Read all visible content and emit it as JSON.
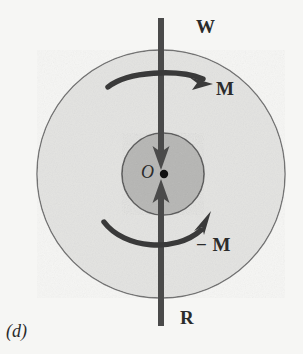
{
  "figure": {
    "caption": "(d)",
    "background_color": "#f6f6f4",
    "outer_disk": {
      "name": "outer-disk",
      "fill_color": "#e3e3e1",
      "stroke_color": "#6f6f6f",
      "center_x": 161,
      "center_y": 174,
      "radius": 124
    },
    "inner_disk": {
      "name": "inner-disk",
      "fill_color": "#b6b6b4",
      "stroke_color": "#5a5a5a",
      "center_x": 163,
      "center_y": 174,
      "radius": 41
    },
    "center_point": {
      "name": "center-point-O",
      "label": "O",
      "color": "#111111",
      "x": 164,
      "y": 174,
      "radius": 4
    },
    "arrow_color": "#4a4a4a",
    "moment_arrow_color": "#3a3a3a",
    "labels": {
      "top_force": "W",
      "top_moment": "M",
      "center": "O",
      "bottom_moment": "− M",
      "bottom_force": "R",
      "caption": "(d)"
    },
    "forces": [
      {
        "name": "force-W",
        "label": "W",
        "direction": "down",
        "tail_x": 161,
        "tail_y": 18,
        "head_x": 161,
        "head_y": 167
      },
      {
        "name": "force-R",
        "label": "R",
        "direction": "up",
        "tail_x": 161,
        "tail_y": 326,
        "head_x": 161,
        "head_y": 182
      }
    ],
    "moments": [
      {
        "name": "moment-M",
        "label": "M",
        "sense": "clockwise",
        "position": "above-center"
      },
      {
        "name": "moment-minus-M",
        "label": "− M",
        "sense": "counterclockwise-drawn-from-left",
        "position": "below-center"
      }
    ]
  }
}
